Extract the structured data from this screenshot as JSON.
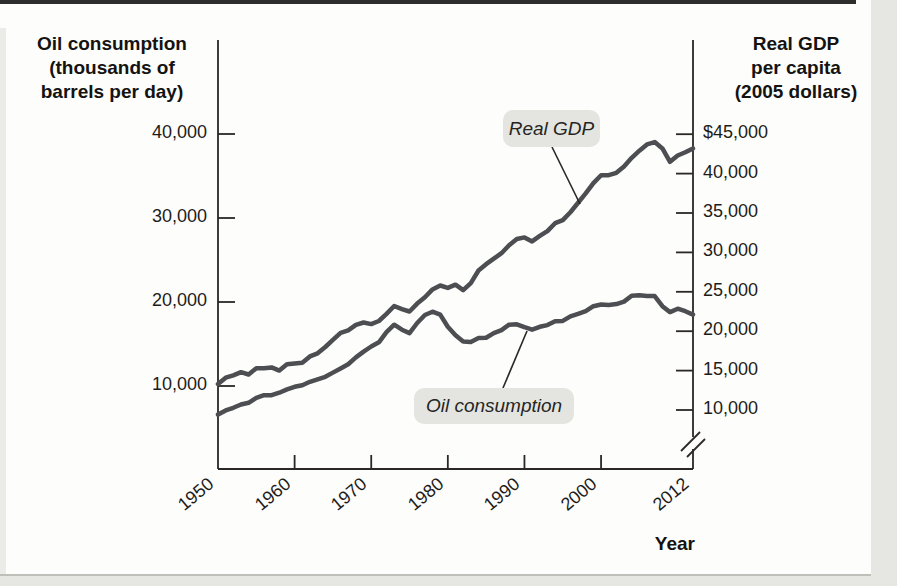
{
  "chart_data": {
    "type": "line",
    "title": "",
    "grid": false,
    "legend_position": "inline-callouts",
    "x": {
      "label": "Year",
      "range": [
        1950,
        2012
      ],
      "ticks": [
        1950,
        1960,
        1970,
        1980,
        1990,
        2000,
        2012
      ],
      "tick_labels": [
        "1950",
        "1960",
        "1970",
        "1980",
        "1990",
        "2000",
        "2012"
      ]
    },
    "y_left": {
      "title_lines": [
        "Oil consumption",
        "(thousands of",
        "barrels per day)"
      ],
      "range": [
        0,
        45000
      ],
      "ticks": [
        10000,
        20000,
        30000,
        40000
      ],
      "tick_labels": [
        "10,000",
        "20,000",
        "30,000",
        "40,000"
      ]
    },
    "y_right": {
      "title_lines": [
        "Real GDP",
        "per capita",
        "(2005 dollars)"
      ],
      "range": [
        10000,
        47000
      ],
      "axis_break": true,
      "ticks": [
        45000,
        40000,
        35000,
        30000,
        25000,
        20000,
        15000,
        10000
      ],
      "tick_labels": [
        "$45,000",
        "40,000",
        "35,000",
        "30,000",
        "25,000",
        "20,000",
        "15,000",
        "10,000"
      ]
    },
    "series": [
      {
        "name": "Real GDP",
        "axis": "right",
        "start_year": 1950,
        "values": [
          13300,
          14100,
          14400,
          14800,
          14500,
          15300,
          15300,
          15400,
          15000,
          15800,
          15900,
          16000,
          16800,
          17200,
          18000,
          18900,
          19800,
          20100,
          20800,
          21100,
          20900,
          21300,
          22200,
          23200,
          22800,
          22500,
          23500,
          24300,
          25300,
          25800,
          25500,
          25900,
          25200,
          26100,
          27700,
          28500,
          29200,
          29900,
          30900,
          31700,
          31900,
          31400,
          32100,
          32700,
          33700,
          34100,
          35100,
          36300,
          37500,
          38800,
          39800,
          39800,
          40100,
          40900,
          42000,
          42900,
          43700,
          44000,
          43200,
          41500,
          42300,
          42700,
          43200
        ]
      },
      {
        "name": "Oil consumption",
        "axis": "left",
        "start_year": 1950,
        "values": [
          6600,
          7100,
          7400,
          7800,
          8000,
          8600,
          8900,
          8900,
          9200,
          9600,
          9900,
          10100,
          10500,
          10800,
          11100,
          11600,
          12100,
          12600,
          13400,
          14100,
          14700,
          15200,
          16400,
          17300,
          16700,
          16300,
          17500,
          18450,
          18850,
          18500,
          17050,
          16050,
          15300,
          15250,
          15700,
          15750,
          16300,
          16650,
          17300,
          17350,
          17000,
          16700,
          17050,
          17250,
          17700,
          17750,
          18300,
          18600,
          18900,
          19500,
          19700,
          19650,
          19750,
          20050,
          20750,
          20800,
          20700,
          20700,
          19500,
          18800,
          19200,
          18900,
          18500
        ]
      }
    ],
    "annotations": [
      {
        "text": "Real GDP",
        "series": "Real GDP"
      },
      {
        "text": "Oil consumption",
        "series": "Oil consumption"
      }
    ]
  },
  "colors": {
    "series_line": "#4d4e52",
    "axis": "#2a2724",
    "text": "#1d1c1a",
    "annotation_box_bg": "#e4e5e1",
    "figure_bg": "#fdfdfb",
    "page_band": "#e6e6e2",
    "top_rule": "#2e2e2e"
  }
}
